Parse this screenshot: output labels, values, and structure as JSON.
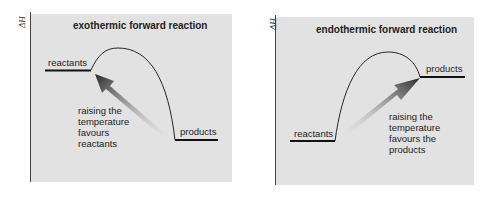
{
  "panels": [
    {
      "title": "exothermic forward reaction",
      "y_axis_label": "ΔH",
      "reactants_label": "reactants",
      "products_label": "products",
      "annotation": [
        "raising the",
        "temperature",
        "favours",
        "reactants"
      ]
    },
    {
      "title": "endothermic forward reaction",
      "y_axis_label": "ΔH",
      "reactants_label": "reactants",
      "products_label": "products",
      "annotation": [
        "raising the",
        "temperature",
        "favours the",
        "products"
      ]
    }
  ],
  "colors": {
    "panel_background": "#e2e2e2",
    "line": "#111111",
    "arrow_dark": "#2a2a2a"
  }
}
